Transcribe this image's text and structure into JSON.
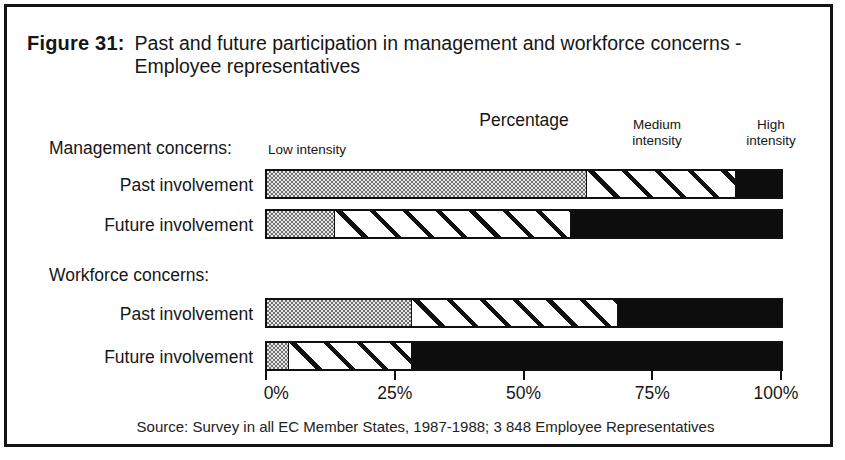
{
  "figure": {
    "label": "Figure 31:",
    "title_line1": "Past and future participation in management and workforce concerns -",
    "title_line2": "Employee representatives"
  },
  "source_note": "Source: Survey in all EC Member States, 1987-1988; 3 848 Employee Representatives",
  "chart_data": {
    "type": "bar",
    "orientation": "horizontal-stacked",
    "title": "Percentage",
    "unit": "%",
    "xlim": [
      0,
      100
    ],
    "x_ticks": [
      "0%",
      "25%",
      "50%",
      "75%",
      "100%"
    ],
    "legend": [
      "Low intensity",
      "Medium intensity",
      "High intensity"
    ],
    "legend_styles": [
      "stipple",
      "diagonal-hatch",
      "solid-black"
    ],
    "groups": [
      {
        "label": "Management concerns:",
        "rows": [
          {
            "label": "Past involvement",
            "values": [
              62,
              29,
              9
            ]
          },
          {
            "label": "Future involvement",
            "values": [
              13,
              46,
              41
            ]
          }
        ]
      },
      {
        "label": "Workforce concerns:",
        "rows": [
          {
            "label": "Past involvement",
            "values": [
              28,
              40,
              32
            ]
          },
          {
            "label": "Future involvement",
            "values": [
              4,
              24,
              72
            ]
          }
        ]
      }
    ]
  }
}
